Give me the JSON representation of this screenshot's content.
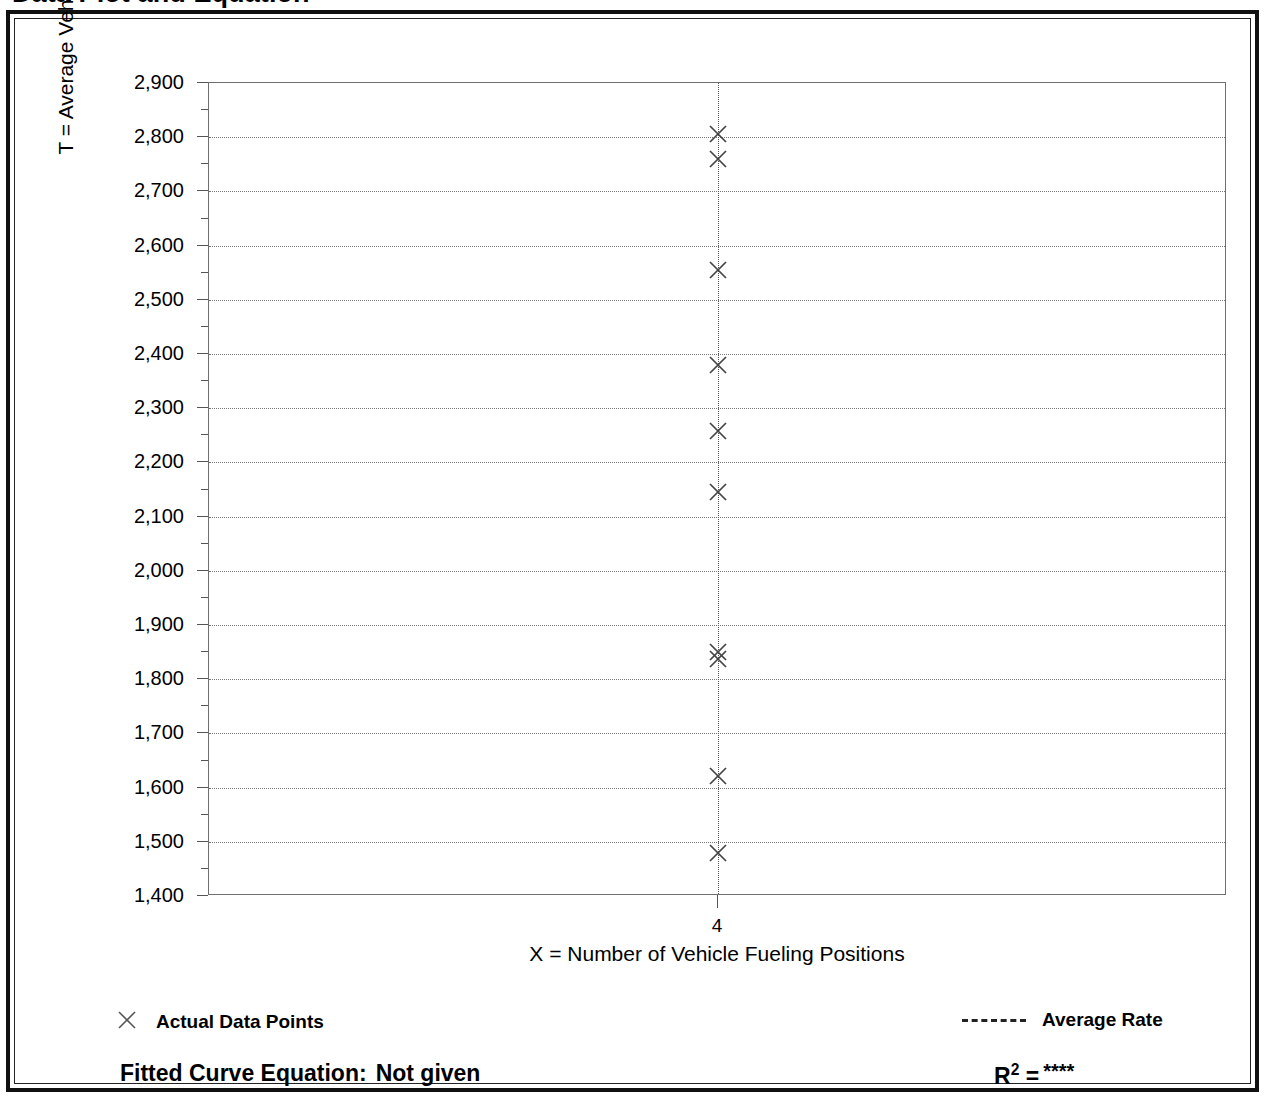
{
  "title": "Data Plot and Equation",
  "chart_data": {
    "type": "scatter",
    "title": "Data Plot and Equation",
    "xlabel": "X = Number of Vehicle Fueling Positions",
    "ylabel": "T = Average Vehicle Trip Ends",
    "xlim": [
      3.0,
      5.0
    ],
    "ylim": [
      1400,
      2900
    ],
    "grid": true,
    "y_ticks": [
      1400,
      1500,
      1600,
      1700,
      1800,
      1900,
      2000,
      2100,
      2200,
      2300,
      2400,
      2500,
      2600,
      2700,
      2800,
      2900
    ],
    "y_tick_labels": [
      "1,400",
      "1,500",
      "1,600",
      "1,700",
      "1,800",
      "1,900",
      "2,000",
      "2,100",
      "2,200",
      "2,300",
      "2,400",
      "2,500",
      "2,600",
      "2,700",
      "2,800",
      "2,900"
    ],
    "y_minor_tick_interval": 50,
    "x_ticks": [
      4
    ],
    "x_tick_labels": [
      "4"
    ],
    "series": [
      {
        "name": "Actual Data Points",
        "marker": "x",
        "x": [
          4,
          4,
          4,
          4,
          4,
          4,
          4,
          4,
          4,
          4
        ],
        "values": [
          2805,
          2760,
          2555,
          2380,
          2258,
          2145,
          1850,
          1838,
          1622,
          1480
        ]
      }
    ],
    "annotations": [
      {
        "name": "average-rate-line",
        "type": "vline",
        "x": 4,
        "style": "dotted",
        "label": "Average Rate"
      }
    ],
    "legend": [
      {
        "label": "Actual Data Points",
        "marker": "x",
        "position": "bottom-left"
      },
      {
        "label": "Average Rate",
        "marker": "dashed-line",
        "position": "bottom-right"
      }
    ]
  },
  "legend": {
    "actual_label": "Actual Data Points",
    "average_label": "Average Rate"
  },
  "footer": {
    "equation_label": "Fitted Curve Equation:",
    "equation_value": "Not given",
    "r_label": "R",
    "r_exponent": "2",
    "r_equals": "=",
    "r_value": "****"
  }
}
